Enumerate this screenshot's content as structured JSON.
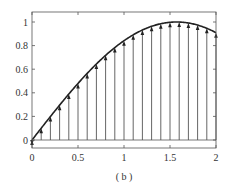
{
  "chart_data": {
    "type": "line",
    "title": "",
    "caption": "( b )",
    "xlabel": "",
    "ylabel": "",
    "xlim": [
      0,
      2
    ],
    "ylim": [
      -0.1,
      1.05
    ],
    "grid": false,
    "legend": null,
    "x_ticks": [
      0,
      0.5,
      1,
      1.5,
      2
    ],
    "x_tick_labels": [
      "0",
      "0.5",
      "1",
      "1.5",
      "2"
    ],
    "y_ticks": [
      0,
      0.2,
      0.4,
      0.6,
      0.8,
      1
    ],
    "y_tick_labels": [
      "0",
      "0.2",
      "0.4",
      "0.6",
      "0.8",
      "1"
    ],
    "series": [
      {
        "name": "curve",
        "kind": "line",
        "function": "sin(x)",
        "color": "#222222",
        "x": [
          0,
          0.1,
          0.2,
          0.3,
          0.4,
          0.5,
          0.6,
          0.7,
          0.8,
          0.9,
          1.0,
          1.1,
          1.2,
          1.3,
          1.4,
          1.5,
          1.6,
          1.7,
          1.8,
          1.9,
          2.0
        ],
        "values": [
          0,
          0.0998,
          0.1987,
          0.2955,
          0.3894,
          0.4794,
          0.5646,
          0.6442,
          0.7174,
          0.7833,
          0.8415,
          0.8912,
          0.932,
          0.9636,
          0.9854,
          0.9975,
          0.9996,
          0.9917,
          0.9738,
          0.9463,
          0.9093
        ]
      },
      {
        "name": "samples",
        "kind": "stem-arrows",
        "color": "#444444",
        "x": [
          0,
          0.1,
          0.2,
          0.3,
          0.4,
          0.5,
          0.6,
          0.7,
          0.8,
          0.9,
          1.0,
          1.1,
          1.2,
          1.3,
          1.4,
          1.5,
          1.6,
          1.7,
          1.8,
          1.9,
          2.0
        ],
        "values": [
          0,
          0.0998,
          0.1987,
          0.2955,
          0.3894,
          0.4794,
          0.5646,
          0.6442,
          0.7174,
          0.7833,
          0.8415,
          0.8912,
          0.932,
          0.9636,
          0.9854,
          0.9975,
          0.9996,
          0.9917,
          0.9738,
          0.9463,
          0.9093
        ]
      }
    ]
  },
  "colors": {
    "frame": "#555555",
    "curve": "#222222",
    "stem": "#555555",
    "text": "#333333",
    "background": "#ffffff"
  },
  "layout": {
    "px_x0": 32,
    "px_x1": 216,
    "px_y0": 140,
    "px_y1": 22,
    "frame_top": 12,
    "frame_bottom": 148
  }
}
